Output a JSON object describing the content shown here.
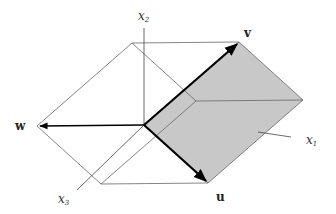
{
  "diagram": {
    "type": "parallelepiped-vectors",
    "colors": {
      "shade": "#c8c8c8",
      "edge": "#555555",
      "vector": "#000000"
    },
    "vectors": {
      "u": {
        "label": "u"
      },
      "v": {
        "label": "v"
      },
      "w": {
        "label": "w"
      }
    },
    "axes": {
      "x1": {
        "base": "x",
        "sub": "1"
      },
      "x2": {
        "base": "x",
        "sub": "2"
      },
      "x3": {
        "base": "x",
        "sub": "3"
      }
    }
  }
}
